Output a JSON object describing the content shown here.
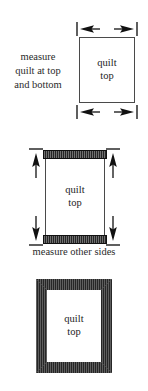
{
  "document": {
    "title": "quilt border measuring diagram",
    "background_color": "#ffffff",
    "ink_color": "#1a1a1a",
    "strip_color": "#262626"
  },
  "figures": [
    {
      "id": "figure-1",
      "caption": "measure\nquilt at top\nand bottom",
      "caption_lines": [
        "measure",
        "quilt at top",
        "and bottom"
      ],
      "quilt_label_lines": [
        "quilt",
        "top"
      ],
      "dimension_arrows": [
        {
          "name": "top-width-dimension",
          "orientation": "horizontal",
          "heads": "both"
        },
        {
          "name": "bottom-width-dimension",
          "orientation": "horizontal",
          "heads": "both"
        }
      ]
    },
    {
      "id": "figure-2",
      "caption": "measure other sides",
      "quilt_label_lines": [
        "quilt",
        "top"
      ],
      "strips": [
        "top-border-strip",
        "bottom-border-strip"
      ],
      "dimension_arrows": [
        {
          "name": "left-height-dimension",
          "orientation": "vertical",
          "heads": "both"
        },
        {
          "name": "right-height-dimension",
          "orientation": "vertical",
          "heads": "both"
        }
      ]
    },
    {
      "id": "figure-3",
      "caption": "",
      "quilt_label_lines": [
        "quilt",
        "top"
      ],
      "strips": [
        "top-border-strip",
        "bottom-border-strip",
        "left-border-strip",
        "right-border-strip"
      ]
    }
  ]
}
